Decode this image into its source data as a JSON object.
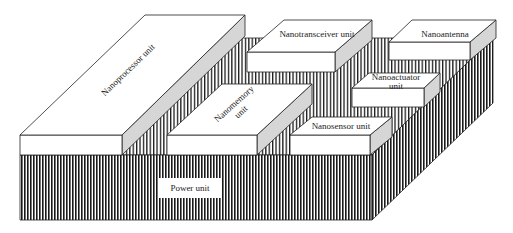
{
  "diagram": {
    "colors": {
      "top_face": "#ffffff",
      "side_face": "#d6d6d6",
      "hatch_line": "#1a1a1a",
      "outline": "#222222",
      "background": "#ffffff"
    },
    "base": {
      "label": "Power unit"
    },
    "components": [
      {
        "id": "nanoprocessor",
        "label": "Nanoprocessor unit"
      },
      {
        "id": "nanotransceiver",
        "label": "Nanotransceiver unit"
      },
      {
        "id": "nanoantenna",
        "label": "Nanoantenna"
      },
      {
        "id": "nanoactuator",
        "label_line1": "Nanoactuator",
        "label_line2": "unit"
      },
      {
        "id": "nanomemory",
        "label_line1": "Nanomemory",
        "label_line2": "unit"
      },
      {
        "id": "nanosensor",
        "label": "Nanosensor unit"
      }
    ]
  }
}
